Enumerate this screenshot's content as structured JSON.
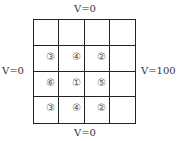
{
  "boundary": {
    "top": "V=0",
    "bottom": "V=0",
    "left": "V=0",
    "right": "V=100"
  },
  "grid": {
    "rows": 4,
    "cols": 4,
    "cells": [
      [
        "",
        "",
        "",
        ""
      ],
      [
        "③",
        "④",
        "②",
        ""
      ],
      [
        "⑥",
        "①",
        "⑤",
        ""
      ],
      [
        "③",
        "④",
        "②",
        ""
      ]
    ]
  }
}
